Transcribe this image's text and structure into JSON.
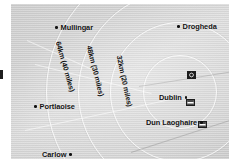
{
  "figure": {
    "name": "dublin-distance-ring-map",
    "background_color": "#ffffff",
    "plate_color": "#d4d4d4"
  },
  "places": [
    {
      "id": "mullingar",
      "label": "Mullingar",
      "dot_side": "left",
      "x": 44,
      "y": 20
    },
    {
      "id": "drogheda",
      "label": "Drogheda",
      "dot_side": "left",
      "x": 166,
      "y": 19
    },
    {
      "id": "portlaoise",
      "label": "Portlaoise",
      "dot_side": "left",
      "x": 23,
      "y": 99
    },
    {
      "id": "dublin",
      "label": "Dublin",
      "dot_side": "right",
      "x": 148,
      "y": 90
    },
    {
      "id": "dun-laoghaire",
      "label": "Dun Laoghaire",
      "dot_side": "right",
      "x": 135,
      "y": 115
    },
    {
      "id": "carlow",
      "label": "Carlow",
      "dot_side": "right",
      "x": 31,
      "y": 147
    }
  ],
  "radius_labels": [
    {
      "id": "ring-64km",
      "text": "64km (40 miles)",
      "x": 47,
      "y": 34,
      "angle": 74
    },
    {
      "id": "ring-48km",
      "text": "48km (30 miles)",
      "x": 78,
      "y": 38,
      "angle": 76
    },
    {
      "id": "ring-32km",
      "text": "32km (20 miles)",
      "x": 108,
      "y": 48,
      "angle": 78
    }
  ],
  "rings": [
    {
      "id": "ring-inner",
      "radius": 36
    },
    {
      "id": "ring-middle",
      "radius": 69
    },
    {
      "id": "ring-outer",
      "radius": 101
    },
    {
      "id": "ring-far",
      "radius": 133
    }
  ],
  "ring_center": {
    "x": 169,
    "y": 88
  },
  "symbols": [
    {
      "id": "dublin-airport",
      "type": "airport-icon",
      "x": 176,
      "y": 67
    },
    {
      "id": "dublin-port",
      "type": "ferry-icon",
      "x": 175,
      "y": 95
    },
    {
      "id": "dun-laoghaire-harbour",
      "type": "ferry-icon",
      "x": 187,
      "y": 117
    }
  ],
  "hairlines": [
    {
      "id": "coast-a",
      "x": 24,
      "y": 60,
      "length": 120,
      "angle": 14
    },
    {
      "id": "coast-b",
      "x": 128,
      "y": 82,
      "length": 96,
      "angle": -9
    },
    {
      "id": "coast-c",
      "x": 14,
      "y": 126,
      "length": 150,
      "angle": -12
    },
    {
      "id": "coast-d",
      "x": 120,
      "y": 148,
      "length": 110,
      "angle": -18
    },
    {
      "id": "coast-e",
      "x": 16,
      "y": 36,
      "length": 70,
      "angle": 24
    }
  ],
  "margin_mark": {
    "id": "page-margin-tick"
  }
}
